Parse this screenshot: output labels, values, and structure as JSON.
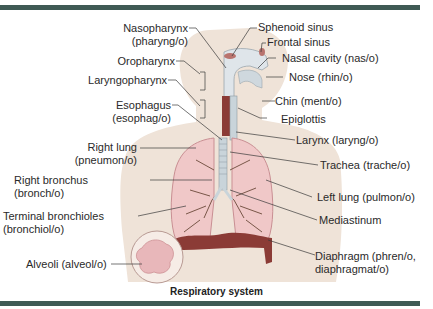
{
  "figure": {
    "caption": "Respiratory system",
    "colors": {
      "frame_bar": "#3f5a55",
      "body_silhouette": "#efe3d8",
      "lung_fill": "#f0c8c8",
      "lung_edge": "#c98f93",
      "airway": "#c9d4da",
      "diaphragm": "#8b3b36",
      "alveoli": "#e8b7ba"
    }
  },
  "labels_left": [
    {
      "id": "nasopharynx",
      "line1": "Nasopharynx",
      "line2": "(pharyng/o)"
    },
    {
      "id": "oropharynx",
      "line1": "Oropharynx"
    },
    {
      "id": "laryngopharynx",
      "line1": "Laryngopharynx"
    },
    {
      "id": "esophagus",
      "line1": "Esophagus",
      "line2": "(esophag/o)"
    },
    {
      "id": "right-lung",
      "line1": "Right lung",
      "line2": "(pneumon/o)"
    },
    {
      "id": "right-bronchus",
      "line1": "Right bronchus",
      "line2": "(bronch/o)"
    },
    {
      "id": "terminal-bronchioles",
      "line1": "Terminal bronchioles",
      "line2": "(bronchiol/o)"
    },
    {
      "id": "alveoli",
      "line1": "Alveoli (alveol/o)"
    }
  ],
  "labels_right": [
    {
      "id": "sphenoid-sinus",
      "line1": "Sphenoid sinus"
    },
    {
      "id": "frontal-sinus",
      "line1": "Frontal sinus"
    },
    {
      "id": "nasal-cavity",
      "line1": "Nasal cavity (nas/o)"
    },
    {
      "id": "nose",
      "line1": "Nose (rhin/o)"
    },
    {
      "id": "chin",
      "line1": "Chin (ment/o)"
    },
    {
      "id": "epiglottis",
      "line1": "Epiglottis"
    },
    {
      "id": "larynx",
      "line1": "Larynx (laryng/o)"
    },
    {
      "id": "trachea",
      "line1": "Trachea (trache/o)"
    },
    {
      "id": "left-lung",
      "line1": "Left lung (pulmon/o)"
    },
    {
      "id": "mediastinum",
      "line1": "Mediastinum"
    },
    {
      "id": "diaphragm",
      "line1": "Diaphragm (phren/o,",
      "line2": "diaphragmat/o)"
    }
  ]
}
